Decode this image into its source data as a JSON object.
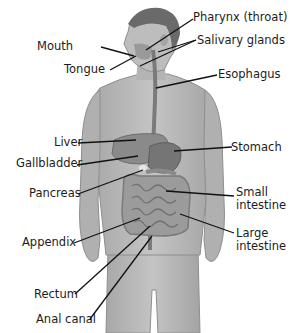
{
  "diagram": {
    "labels_left": [
      {
        "id": "mouth",
        "text": "Mouth",
        "x": 65,
        "y": 41
      },
      {
        "id": "tongue",
        "text": "Tongue",
        "x": 65,
        "y": 64
      },
      {
        "id": "liver",
        "text": "Liver",
        "x": 40,
        "y": 136
      },
      {
        "id": "gallbladder",
        "text": "Gallbladder",
        "x": 16,
        "y": 157
      },
      {
        "id": "pancreas",
        "text": "Pancreas",
        "x": 29,
        "y": 187
      },
      {
        "id": "appendix",
        "text": "Appendix",
        "x": 22,
        "y": 236
      },
      {
        "id": "rectum",
        "text": "Rectum",
        "x": 34,
        "y": 288
      },
      {
        "id": "anal_canal",
        "text": "Anal canal",
        "x": 36,
        "y": 313
      }
    ],
    "labels_right": [
      {
        "id": "pharynx",
        "text": "Pharynx (throat)",
        "x": 193,
        "y": 12
      },
      {
        "id": "salivary",
        "text": "Salivary glands",
        "x": 197,
        "y": 34
      },
      {
        "id": "esophagus",
        "text": "Esophagus",
        "x": 218,
        "y": 68
      },
      {
        "id": "stomach",
        "text": "Stomach",
        "x": 231,
        "y": 141
      },
      {
        "id": "small_intestine_1",
        "text": "Small",
        "x": 236,
        "y": 186
      },
      {
        "id": "small_intestine_2",
        "text": "intestine",
        "x": 236,
        "y": 199
      },
      {
        "id": "large_intestine_1",
        "text": "Large",
        "x": 236,
        "y": 227
      },
      {
        "id": "large_intestine_2",
        "text": "intestine",
        "x": 236,
        "y": 240
      }
    ]
  },
  "colors": {
    "body": "#b9b9b9",
    "body_dark": "#8e8e8e",
    "hair": "#6a6a6a",
    "organ": "#8a8a8a",
    "organ_dark": "#6e6e6e",
    "intestine": "#9b9b9b",
    "leader": "#111111",
    "text": "#1c1c1c"
  }
}
